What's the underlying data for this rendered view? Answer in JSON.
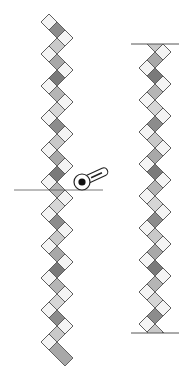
{
  "figure": {
    "colors": {
      "background": "#ffffff",
      "outline": "#555555",
      "white_square": "#f4f4f4",
      "shades": [
        "#8c8c8c",
        "#c9c9c9",
        "#a8a8a8",
        "#7a7a7a",
        "#b5b5b5",
        "#d6d6d6"
      ],
      "cutter_body": "#ffffff",
      "cutter_hub": "#111111",
      "cut_line": "#555555"
    },
    "left_strip": {
      "center_x": 57,
      "top_y": 14,
      "units": 21,
      "pitch": 16,
      "square_size": 11.3
    },
    "right_strip": {
      "center_x": 155,
      "top_y": 44,
      "bottom_y": 333,
      "units": 18,
      "pitch": 16,
      "square_size": 11.3
    },
    "cut_line": {
      "x1": 14,
      "x2": 103,
      "y": 190
    },
    "rotary_cutter": {
      "hub_x": 82,
      "hub_y": 182,
      "handle_angle_deg": -25
    }
  }
}
